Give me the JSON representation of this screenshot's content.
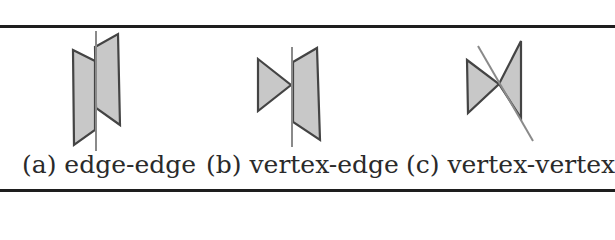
{
  "figure": {
    "panels": [
      {
        "id": "a",
        "caption": "(a) edge-edge"
      },
      {
        "id": "b",
        "caption": "(b) vertex-edge"
      },
      {
        "id": "c",
        "caption": "(c) vertex-vertex"
      }
    ],
    "colors": {
      "fill": "#c8c8c8",
      "stroke": "#444444",
      "axis_line": "#8a8a8a",
      "rule": "#1e1e1e"
    }
  }
}
